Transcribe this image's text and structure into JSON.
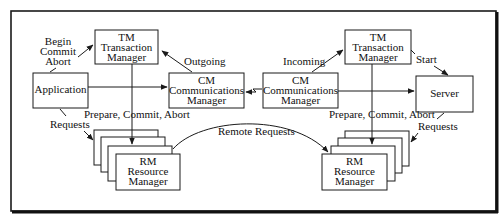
{
  "diagram": {
    "type": "distributed transaction processing architecture",
    "nodes": {
      "application": {
        "label": "Application"
      },
      "tm_left": {
        "line1": "TM",
        "line2": "Transaction",
        "line3": "Manager"
      },
      "cm_left": {
        "line1": "CM",
        "line2": "Communications",
        "line3": "Manager"
      },
      "rm_left": {
        "line1": "RM",
        "line2": "Resource",
        "line3": "Manager"
      },
      "cm_right": {
        "line1": "CM",
        "line2": "Communications",
        "line3": "Manager"
      },
      "tm_right": {
        "line1": "TM",
        "line2": "Transaction",
        "line3": "Manager"
      },
      "server": {
        "label": "Server"
      },
      "rm_right": {
        "line1": "RM",
        "line2": "Resource",
        "line3": "Manager"
      }
    },
    "edges": {
      "app_to_tm": {
        "line1": "Begin",
        "line2": "Commit",
        "line3": "Abort"
      },
      "cm_to_tm_left": {
        "label": "Outgoing"
      },
      "cm_to_tm_right": {
        "label": "Incoming"
      },
      "tm_to_server": {
        "label": "Start"
      },
      "tm_to_rm_left": {
        "label": "Prepare, Commit, Abort"
      },
      "tm_to_rm_right": {
        "label": "Prepare, Commit, Abort"
      },
      "app_to_rm": {
        "label": "Requests"
      },
      "server_to_rm": {
        "label": "Requests"
      },
      "cm_to_remote_rm": {
        "label": "Remote Requests"
      }
    },
    "colors": {
      "stroke": "#1a1a1a",
      "background": "#ffffff",
      "text": "#111111"
    }
  }
}
